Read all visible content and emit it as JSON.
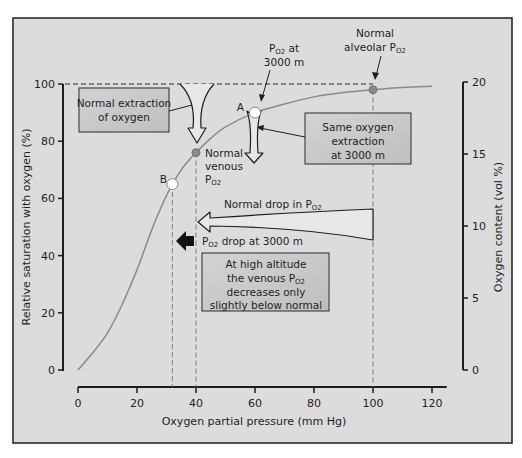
{
  "chart_data": {
    "type": "line",
    "title": "",
    "xlabel": "Oxygen partial pressure (mm Hg)",
    "ylabel": "Relative saturation with oxygen (%)",
    "y2label": "Oxygen content (vol %)",
    "xlim": [
      0,
      125
    ],
    "ylim": [
      0,
      100
    ],
    "y2lim": [
      0,
      20
    ],
    "grid": false,
    "x_ticks": [
      0,
      20,
      40,
      60,
      80,
      100,
      120
    ],
    "y_ticks": [
      0,
      20,
      40,
      60,
      80,
      100
    ],
    "y2_ticks": [
      0,
      5,
      10,
      15,
      20
    ],
    "series": [
      {
        "name": "Oxygen dissociation curve",
        "color": "#8a8a8a",
        "x": [
          0,
          5,
          10,
          15,
          20,
          25,
          30,
          35,
          40,
          45,
          50,
          60,
          70,
          80,
          90,
          100,
          110,
          120
        ],
        "y": [
          0,
          6,
          13,
          23,
          35,
          49,
          61,
          70,
          76,
          81,
          85,
          90,
          93,
          95.5,
          97,
          98,
          98.8,
          99.2
        ]
      }
    ],
    "points": [
      {
        "id": "normal-alveolar",
        "label": "Normal alveolar PO2",
        "x": 100,
        "y": 98,
        "style": "filled",
        "color": "#8a8a8a"
      },
      {
        "id": "normal-venous",
        "label": "Normal venous PO2",
        "x": 40,
        "y": 76,
        "style": "filled",
        "color": "#8a8a8a"
      },
      {
        "id": "A",
        "label": "A",
        "x": 60,
        "y": 90,
        "style": "open",
        "color": "#ffffff"
      },
      {
        "id": "B",
        "label": "B",
        "x": 32,
        "y": 65,
        "style": "open",
        "color": "#ffffff"
      }
    ],
    "reference_lines": [
      {
        "orientation": "horizontal",
        "y": 100,
        "from_x": 0,
        "to_x": 100,
        "style": "dashed"
      },
      {
        "orientation": "vertical",
        "x": 100,
        "style": "dashed"
      },
      {
        "orientation": "vertical",
        "x": 40,
        "style": "dashed"
      },
      {
        "orientation": "vertical",
        "x": 32,
        "style": "dashed"
      }
    ],
    "annotations": {
      "normal_alveolar": {
        "line1": "Normal",
        "line2": "alveolar P",
        "sub": "O",
        "sub2": "2"
      },
      "po2_at_3000": {
        "line1_pre": "P",
        "line1_sub": "O2",
        "line1_post": " at",
        "line2": "3000 m"
      },
      "normal_extraction": {
        "line1": "Normal extraction",
        "line2": "of oxygen"
      },
      "same_extraction": {
        "line1": "Same oxygen",
        "line2": "extraction",
        "line3": "at 3000 m"
      },
      "normal_venous": {
        "line1": "Normal",
        "line2": "venous",
        "line3_pre": "P",
        "line3_sub": "O2"
      },
      "label_A": "A",
      "label_B": "B",
      "normal_drop": {
        "pre": "Normal drop in P",
        "sub": "O2"
      },
      "drop_3000": {
        "pre": "P",
        "sub": "O2",
        "post": " drop at 3000 m"
      },
      "high_altitude": {
        "line1": "At high altitude",
        "line2_pre": "the venous P",
        "line2_sub": "O2",
        "line3": "decreases only",
        "line4": "slightly below normal"
      }
    }
  },
  "colors": {
    "panel_background": "#dcdcdc",
    "frame": "#2a2a2a",
    "box_fill": "#c9c9c9",
    "curve": "#8a8a8a",
    "text": "#1e1e1e"
  }
}
